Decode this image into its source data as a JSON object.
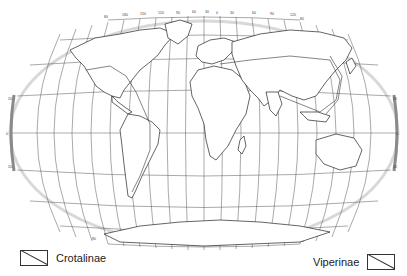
{
  "map": {
    "projection": "world-oval",
    "graticule": {
      "longitude_labels_top": [
        "180",
        "150",
        "120",
        "90",
        "60",
        "30",
        "0",
        "30",
        "60",
        "90",
        "120",
        "150",
        "180"
      ],
      "longitude_labels_bottom": [
        "180",
        "150",
        "120",
        "90",
        "60",
        "30",
        "0",
        "30",
        "60",
        "90",
        "120",
        "150",
        "180"
      ],
      "latitude_labels": [
        "80",
        "60",
        "40",
        "20",
        "0",
        "20",
        "40",
        "60",
        "80"
      ]
    },
    "colors": {
      "land_outline": "#222222",
      "graticule": "#555555",
      "border_band": "#9a9a9a",
      "background": "#ffffff"
    }
  },
  "legend": {
    "items": [
      {
        "label": "Crotalinae"
      },
      {
        "label": "Viperinae"
      }
    ]
  }
}
